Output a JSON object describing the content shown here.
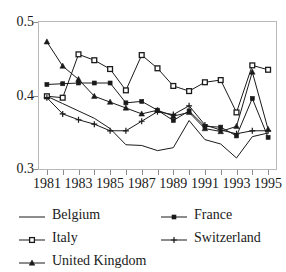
{
  "chart_data": {
    "type": "line",
    "title": "",
    "xlabel": "",
    "ylabel": "",
    "x": [
      1981,
      1982,
      1983,
      1984,
      1985,
      1986,
      1987,
      1988,
      1989,
      1990,
      1991,
      1992,
      1993,
      1994,
      1995
    ],
    "xlim": [
      1980.5,
      1995.5
    ],
    "ylim": [
      0.3,
      0.5
    ],
    "yticks": [
      0.3,
      0.4,
      0.5
    ],
    "ytick_labels": [
      "0.3",
      "0.4",
      "0.5"
    ],
    "xticks": [
      1981,
      1983,
      1985,
      1987,
      1989,
      1991,
      1993,
      1995
    ],
    "xtick_labels": [
      "1981",
      "1983",
      "1985",
      "1987",
      "1989",
      "1991",
      "1993",
      "1995"
    ],
    "grid": false,
    "legend_position": "below",
    "series": [
      {
        "name": "Belgium",
        "marker": "none",
        "color": "#1a1a1a",
        "values": [
          0.399,
          0.389,
          0.379,
          0.369,
          0.355,
          0.333,
          0.332,
          0.325,
          0.329,
          0.366,
          0.34,
          0.334,
          0.315,
          0.344,
          0.349
        ]
      },
      {
        "name": "France",
        "marker": "filled-square",
        "color": "#1a1a1a",
        "values": [
          0.415,
          0.416,
          0.417,
          0.417,
          0.417,
          0.39,
          0.392,
          0.38,
          0.366,
          0.379,
          0.358,
          0.357,
          0.345,
          0.396,
          0.343
        ]
      },
      {
        "name": "Italy",
        "marker": "open-square",
        "color": "#1a1a1a",
        "values": [
          0.399,
          0.397,
          0.456,
          0.448,
          0.436,
          0.407,
          0.455,
          0.437,
          0.413,
          0.406,
          0.418,
          0.421,
          0.377,
          0.441,
          0.435
        ]
      },
      {
        "name": "Switzerland",
        "marker": "plus",
        "color": "#1a1a1a",
        "values": [
          0.397,
          0.375,
          0.367,
          0.361,
          0.352,
          0.352,
          0.365,
          0.378,
          0.374,
          0.386,
          0.36,
          0.353,
          0.348,
          0.352,
          0.352
        ]
      },
      {
        "name": "United Kingdom",
        "marker": "filled-triangle",
        "color": "#1a1a1a",
        "values": [
          0.473,
          0.44,
          0.422,
          0.399,
          0.391,
          0.383,
          0.375,
          0.38,
          0.372,
          0.377,
          0.355,
          0.351,
          0.358,
          0.432,
          0.354
        ]
      }
    ]
  },
  "legend": {
    "entries": [
      {
        "label": "Belgium",
        "marker": "none"
      },
      {
        "label": "France",
        "marker": "filled-square"
      },
      {
        "label": "Italy",
        "marker": "open-square"
      },
      {
        "label": "Switzerland",
        "marker": "plus"
      },
      {
        "label": "United Kingdom",
        "marker": "filled-triangle"
      }
    ]
  },
  "colors": {
    "ink": "#1a1a1a",
    "frame": "#b9b9b9",
    "tick": "#8c8c8c",
    "background": "#ffffff"
  }
}
